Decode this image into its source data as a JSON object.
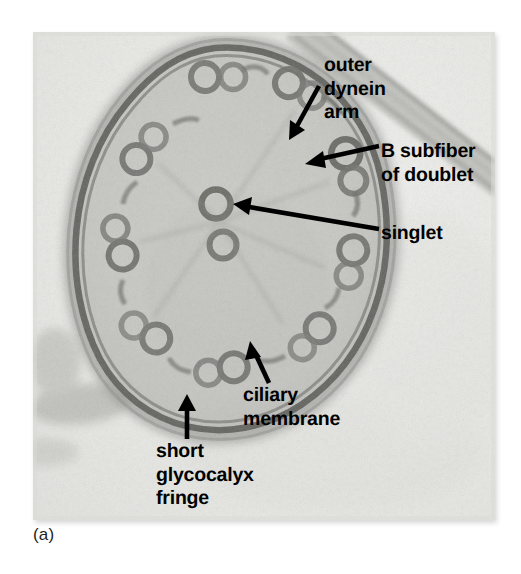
{
  "figure": {
    "panel_caption": "(a)",
    "image_kind": "transmission-electron-micrograph",
    "background_color": "#ffffff",
    "plate_color": "#e9e9e7",
    "label_color": "#000000",
    "arrow_color": "#000000"
  },
  "labels": [
    {
      "id": "outer-dynein-arm",
      "lines": [
        "outer",
        "dynein",
        "arm"
      ],
      "line1": "outer",
      "line2": "dynein",
      "line3": "arm"
    },
    {
      "id": "b-subfiber-of-doublet",
      "lines": [
        "B subfiber",
        "of doublet"
      ],
      "line1": "B subfiber",
      "line2": "of doublet"
    },
    {
      "id": "singlet",
      "lines": [
        "singlet"
      ],
      "line1": "singlet"
    },
    {
      "id": "ciliary-membrane",
      "lines": [
        "ciliary",
        "membrane"
      ],
      "line1": "ciliary",
      "line2": "membrane"
    },
    {
      "id": "short-glycocalyx-fringe",
      "lines": [
        "short",
        "glycocalyx",
        "fringe"
      ],
      "line1": "short",
      "line2": "glycocalyx",
      "line3": "fringe"
    }
  ],
  "arrows": [
    {
      "id": "arrow-outer-dynein-arm",
      "from": [
        319,
        86
      ],
      "to": [
        292,
        134
      ]
    },
    {
      "id": "arrow-b-subfiber",
      "from": [
        379,
        146
      ],
      "to": [
        309,
        163
      ]
    },
    {
      "id": "arrow-singlet",
      "from": [
        379,
        229
      ],
      "to": [
        236,
        204
      ]
    },
    {
      "id": "arrow-ciliary-membrane",
      "from": [
        269,
        383
      ],
      "to": [
        252,
        344
      ]
    },
    {
      "id": "arrow-short-glycocalyx-fringe",
      "from": [
        187,
        439
      ],
      "to": [
        187,
        396
      ]
    }
  ],
  "structures": {
    "axoneme_center": [
      215,
      230
    ],
    "outer_doublet_count": 9,
    "central_singlet_count": 2,
    "membrane_label": "ciliary membrane",
    "glycocalyx_label": "short glycocalyx fringe"
  }
}
